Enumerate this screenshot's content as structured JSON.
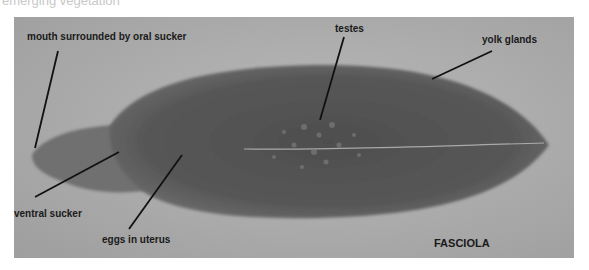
{
  "caption_partial": "emerging vegetation",
  "figure": {
    "title": "FASCIOLA",
    "labels": {
      "mouth": "mouth surrounded by oral sucker",
      "testes": "testes",
      "yolk_glands": "yolk glands",
      "ventral_sucker": "ventral sucker",
      "eggs": "eggs in uterus"
    }
  }
}
